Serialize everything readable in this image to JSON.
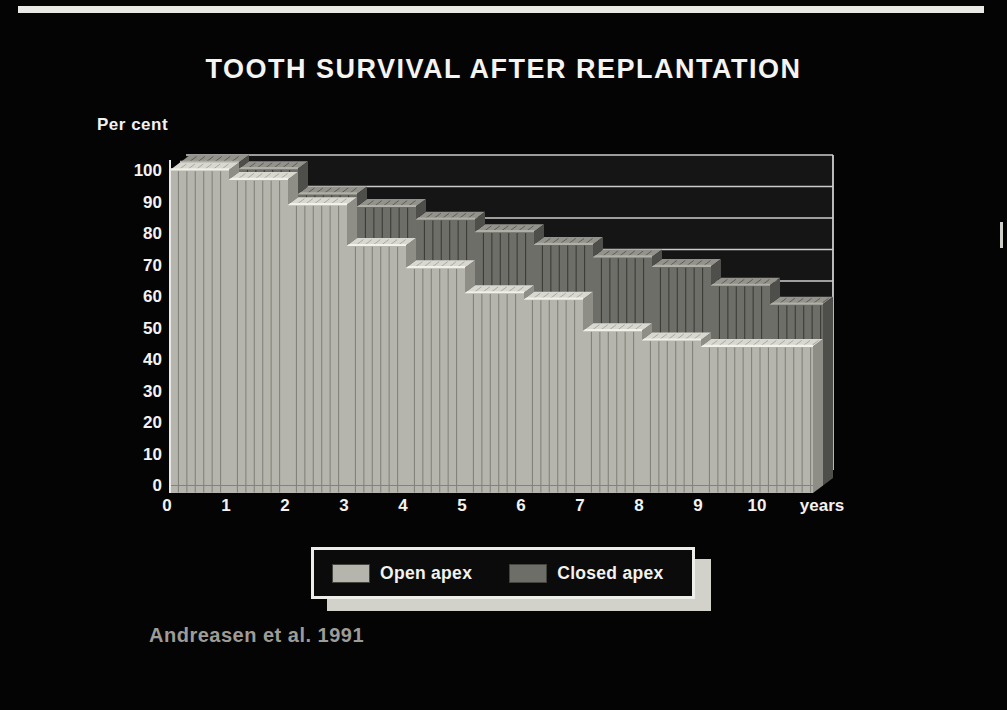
{
  "chart_data": {
    "type": "area",
    "title": "TOOTH SURVIVAL AFTER REPLANTATION",
    "ylabel": "Per cent",
    "x_suffix": "years",
    "annotation": "Andreasen et al. 1991",
    "ylim": [
      0,
      100
    ],
    "y_ticks": [
      0,
      10,
      20,
      30,
      40,
      50,
      60,
      70,
      80,
      90,
      100
    ],
    "x_ticks": [
      0,
      1,
      2,
      3,
      4,
      5,
      6,
      7,
      8,
      9,
      10
    ],
    "legend_position": "bottom",
    "grid": true,
    "series": [
      {
        "name": "Open apex",
        "steps": [
          {
            "from": 0,
            "value": 100
          },
          {
            "from": 1,
            "value": 97
          },
          {
            "from": 2,
            "value": 89
          },
          {
            "from": 3,
            "value": 76
          },
          {
            "from": 4,
            "value": 69
          },
          {
            "from": 5,
            "value": 61
          },
          {
            "from": 6,
            "value": 59
          },
          {
            "from": 7,
            "value": 49
          },
          {
            "from": 8,
            "value": 46
          },
          {
            "from": 9,
            "value": 44
          }
        ],
        "front": "#b5b5ad",
        "top": "#d8d8d0",
        "side": "#8e8e86",
        "stripe": "#83837b",
        "top_tick": "#a9a9a1",
        "highlight": "#f1f1e9"
      },
      {
        "name": "Closed apex",
        "steps": [
          {
            "from": 0,
            "value": 100
          },
          {
            "from": 1,
            "value": 98
          },
          {
            "from": 2,
            "value": 90
          },
          {
            "from": 3,
            "value": 86
          },
          {
            "from": 4,
            "value": 82
          },
          {
            "from": 5,
            "value": 78
          },
          {
            "from": 6,
            "value": 74
          },
          {
            "from": 7,
            "value": 70
          },
          {
            "from": 8,
            "value": 67
          },
          {
            "from": 9,
            "value": 61
          },
          {
            "from": 10,
            "value": 55
          }
        ],
        "front": "#6e6e68",
        "top": "#93938c",
        "side": "#4e4e4a",
        "stripe": "#3c3c38",
        "top_tick": "#5e5e58",
        "highlight": "#b0b0a8"
      }
    ],
    "colors": {
      "background": "#040404",
      "wall": "#151515",
      "gridline": "#cccccc",
      "axis": "#e8e8e6",
      "tick_text": "#f2f2f0"
    }
  }
}
